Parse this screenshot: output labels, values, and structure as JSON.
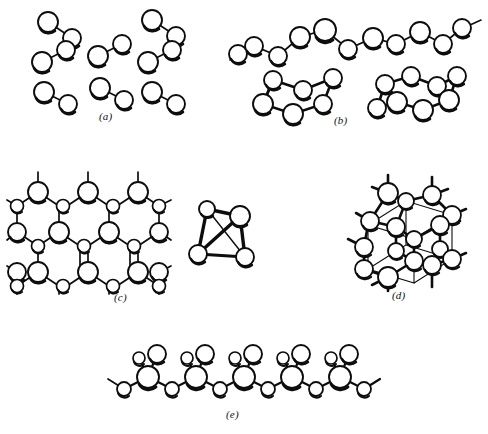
{
  "figure": {
    "background_color": "#ffffff",
    "ink_color": "#0d0d0d",
    "width": 488,
    "height": 434,
    "atom_fill": "#ffffff"
  },
  "panels": [
    {
      "id": "a",
      "label": "(a)",
      "label_x": 99,
      "label_y": 116,
      "structure_type": "discrete-molecules",
      "description": "Discrete diatomic molecules",
      "molecule_count": 8,
      "atoms_per_molecule": 2,
      "molecules": [
        {
          "x1": 48,
          "y1": 22,
          "x2": 72,
          "y2": 38
        },
        {
          "x1": 152,
          "y1": 20,
          "x2": 176,
          "y2": 36
        },
        {
          "x1": 42,
          "y1": 62,
          "x2": 66,
          "y2": 50
        },
        {
          "x1": 98,
          "y1": 56,
          "x2": 122,
          "y2": 44
        },
        {
          "x1": 148,
          "y1": 62,
          "x2": 172,
          "y2": 50
        },
        {
          "x1": 44,
          "y1": 92,
          "x2": 68,
          "y2": 104
        },
        {
          "x1": 100,
          "y1": 88,
          "x2": 124,
          "y2": 100
        },
        {
          "x1": 152,
          "y1": 92,
          "x2": 176,
          "y2": 104
        }
      ]
    },
    {
      "id": "b",
      "label": "(b)",
      "label_x": 334,
      "label_y": 120,
      "structure_type": "chains-and-rings",
      "description": "Helical chain and puckered rings",
      "chain": {
        "atom_count": 11,
        "points": [
          {
            "x": 254,
            "y": 46
          },
          {
            "x": 278,
            "y": 56
          },
          {
            "x": 300,
            "y": 37
          },
          {
            "x": 325,
            "y": 30
          },
          {
            "x": 348,
            "y": 49
          },
          {
            "x": 373,
            "y": 38
          },
          {
            "x": 396,
            "y": 44
          },
          {
            "x": 420,
            "y": 32
          },
          {
            "x": 443,
            "y": 44
          },
          {
            "x": 462,
            "y": 28
          },
          {
            "x": 470,
            "y": 25
          }
        ],
        "stub_left": {
          "x": 238,
          "y": 54
        },
        "stub_right": {
          "x": 482,
          "y": 20
        }
      },
      "ring_small": {
        "atom_count": 6,
        "center_x": 300,
        "center_y": 92,
        "label": "six-membered ring"
      },
      "ring_large": {
        "atom_count": 8,
        "center_x": 422,
        "center_y": 90,
        "label": "eight-membered ring"
      }
    },
    {
      "id": "c",
      "label": "(c)",
      "label_x": 114,
      "label_y": 297,
      "structure_type": "layer-sheet",
      "description": "Two-dimensional hexagonal layer structure",
      "rows": 3,
      "cols": 3,
      "hex_count": 9
    },
    {
      "id": "c2",
      "label": "",
      "structure_type": "tetrahedron",
      "description": "Tetrahedral four-atom molecule",
      "atom_count": 4,
      "vertices": [
        {
          "x": 207,
          "y": 209,
          "r": 8
        },
        {
          "x": 240,
          "y": 216,
          "r": 10
        },
        {
          "x": 198,
          "y": 254,
          "r": 9
        },
        {
          "x": 245,
          "y": 257,
          "r": 9
        }
      ]
    },
    {
      "id": "d",
      "label": "(d)",
      "label_x": 392,
      "label_y": 295,
      "structure_type": "three-dimensional-network",
      "description": "Three-dimensional tetrahedral network (diamond-like)",
      "atom_count": 18
    },
    {
      "id": "e",
      "label": "(e)",
      "label_x": 226,
      "label_y": 414,
      "structure_type": "polymer-chain",
      "description": "Infinite chain with pendant atoms",
      "repeat_units": 5,
      "pendants_per_unit": 2,
      "centers": [
        {
          "x": 148,
          "y": 377
        },
        {
          "x": 196,
          "y": 377
        },
        {
          "x": 244,
          "y": 377
        },
        {
          "x": 292,
          "y": 377
        },
        {
          "x": 340,
          "y": 377
        }
      ],
      "bridges": [
        {
          "x": 124,
          "y": 389
        },
        {
          "x": 172,
          "y": 389
        },
        {
          "x": 220,
          "y": 389
        },
        {
          "x": 268,
          "y": 389
        },
        {
          "x": 316,
          "y": 389
        },
        {
          "x": 364,
          "y": 389
        }
      ],
      "stub_left": {
        "x": 108,
        "y": 379
      },
      "stub_right": {
        "x": 380,
        "y": 379
      }
    }
  ]
}
